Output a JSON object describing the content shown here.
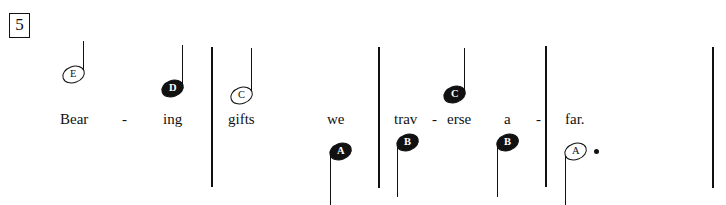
{
  "score": {
    "measure_number": "5",
    "lyrics_line": "Bear - ing gifts we trav - erse a - far.",
    "notes": [
      {
        "id": "note-1",
        "letter": "E",
        "head": "hollow",
        "stem": "up",
        "dotted": false
      },
      {
        "id": "note-2",
        "letter": "D",
        "head": "filled",
        "stem": "up",
        "dotted": false
      },
      {
        "id": "note-3",
        "letter": "C",
        "head": "hollow",
        "stem": "up",
        "dotted": false
      },
      {
        "id": "note-4",
        "letter": "A",
        "head": "filled",
        "stem": "down",
        "dotted": false
      },
      {
        "id": "note-5",
        "letter": "B",
        "head": "filled",
        "stem": "down",
        "dotted": false
      },
      {
        "id": "note-6",
        "letter": "C",
        "head": "filled",
        "stem": "up",
        "dotted": false
      },
      {
        "id": "note-7",
        "letter": "B",
        "head": "filled",
        "stem": "down",
        "dotted": false
      },
      {
        "id": "note-8",
        "letter": "A",
        "head": "hollow",
        "stem": "down",
        "dotted": true
      }
    ],
    "lyric_syllables": [
      {
        "id": "lyric-bear",
        "text": "Bear"
      },
      {
        "id": "lyric-hy-1",
        "text": "-"
      },
      {
        "id": "lyric-ing",
        "text": "ing"
      },
      {
        "id": "lyric-gifts",
        "text": "gifts"
      },
      {
        "id": "lyric-we",
        "text": "we"
      },
      {
        "id": "lyric-trav",
        "text": "trav"
      },
      {
        "id": "lyric-hy-2",
        "text": "-"
      },
      {
        "id": "lyric-erse",
        "text": "erse"
      },
      {
        "id": "lyric-a",
        "text": "a"
      },
      {
        "id": "lyric-hy-3",
        "text": "-"
      },
      {
        "id": "lyric-far",
        "text": "far."
      }
    ],
    "colors": {
      "ink": "#111111",
      "paper": "#ffffff"
    }
  }
}
